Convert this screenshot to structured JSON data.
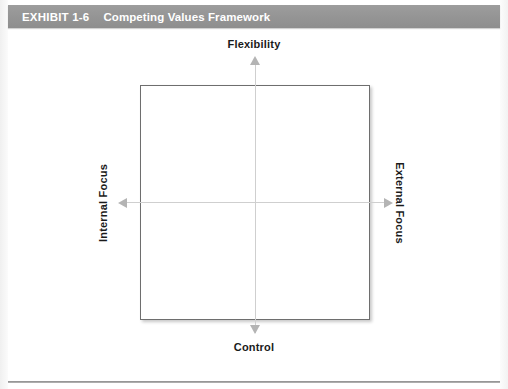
{
  "header": {
    "exhibit_label": "EXHIBIT 1-6",
    "title": "Competing Values Framework",
    "background_color": "#949494",
    "text_color": "#ffffff"
  },
  "diagram": {
    "type": "2x2-framework",
    "box_fill": "#ffffff",
    "box_border_color": "#6e6e6e",
    "axis_line_color": "#cfcfcf",
    "arrow_color": "#b4b4b4",
    "axes": {
      "vertical": {
        "top_label": "Flexibility",
        "bottom_label": "Control",
        "top_arrow_icon": "arrow-up-icon",
        "bottom_arrow_icon": "arrow-down-icon"
      },
      "horizontal": {
        "left_label": "Internal Focus",
        "right_label": "External Focus",
        "left_arrow_icon": "arrow-left-icon",
        "right_arrow_icon": "arrow-right-icon"
      }
    },
    "quadrant_labels": []
  }
}
